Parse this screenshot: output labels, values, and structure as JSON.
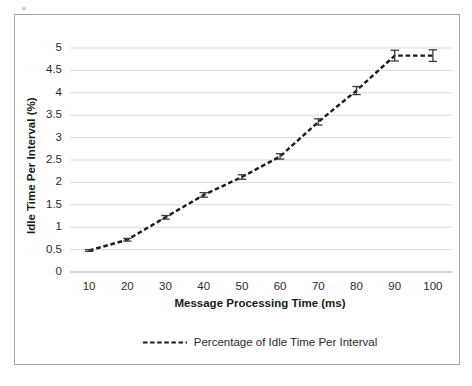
{
  "chart_data": {
    "type": "line",
    "title": "",
    "xlabel": "Message Processing Time (ms)",
    "ylabel": "Idle Time Per Interval  (%)",
    "xlim": [
      5,
      105
    ],
    "ylim": [
      0,
      5
    ],
    "xticks": [
      10,
      20,
      30,
      40,
      50,
      60,
      70,
      80,
      90,
      100
    ],
    "yticks": [
      0,
      0.5,
      1,
      1.5,
      2,
      2.5,
      3,
      3.5,
      4,
      4.5,
      5
    ],
    "xtick_labels": [
      "10",
      "20",
      "30",
      "40",
      "50",
      "60",
      "70",
      "80",
      "90",
      "100"
    ],
    "ytick_labels": [
      "0",
      "0.5",
      "1",
      "1.5",
      "2",
      "2.5",
      "3",
      "3.5",
      "4",
      "4.5",
      "5"
    ],
    "grid": "horizontal",
    "legend_position": "bottom",
    "line_style": "dashed",
    "line_color": "#1a1a1a",
    "grid_color": "#d5d5d5",
    "series": [
      {
        "name": "Percentage of Idle Time Per Interval",
        "x": [
          10,
          20,
          30,
          40,
          50,
          60,
          70,
          80,
          90,
          100
        ],
        "values": [
          0.48,
          0.72,
          1.22,
          1.72,
          2.12,
          2.58,
          3.35,
          4.05,
          4.83,
          4.83
        ],
        "errors": [
          0.02,
          0.03,
          0.04,
          0.05,
          0.05,
          0.06,
          0.07,
          0.09,
          0.12,
          0.13
        ]
      }
    ]
  },
  "legend": {
    "entries": [
      {
        "label": "Percentage of Idle Time Per Interval",
        "color": "#1a1a1a"
      }
    ]
  },
  "axes": {
    "x_title": "Message Processing Time (ms)",
    "y_title": "Idle Time Per Interval  (%)"
  }
}
